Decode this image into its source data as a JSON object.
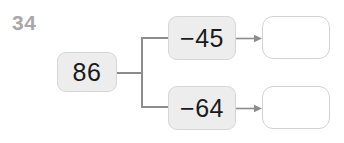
{
  "worksheet": {
    "question_number": "34",
    "start_value": "86",
    "operations": [
      {
        "label": "−45",
        "answer": ""
      },
      {
        "label": "−64",
        "answer": ""
      }
    ],
    "answer_placeholder": "",
    "colors": {
      "background": "#ffffff",
      "question_number": "#a8a8a8",
      "box_fill": "#ededed",
      "box_border": "#d6d6d6",
      "answer_box_border": "#d2d2d2",
      "connector": "#8d8d8d",
      "text": "#1a1a1a"
    }
  }
}
